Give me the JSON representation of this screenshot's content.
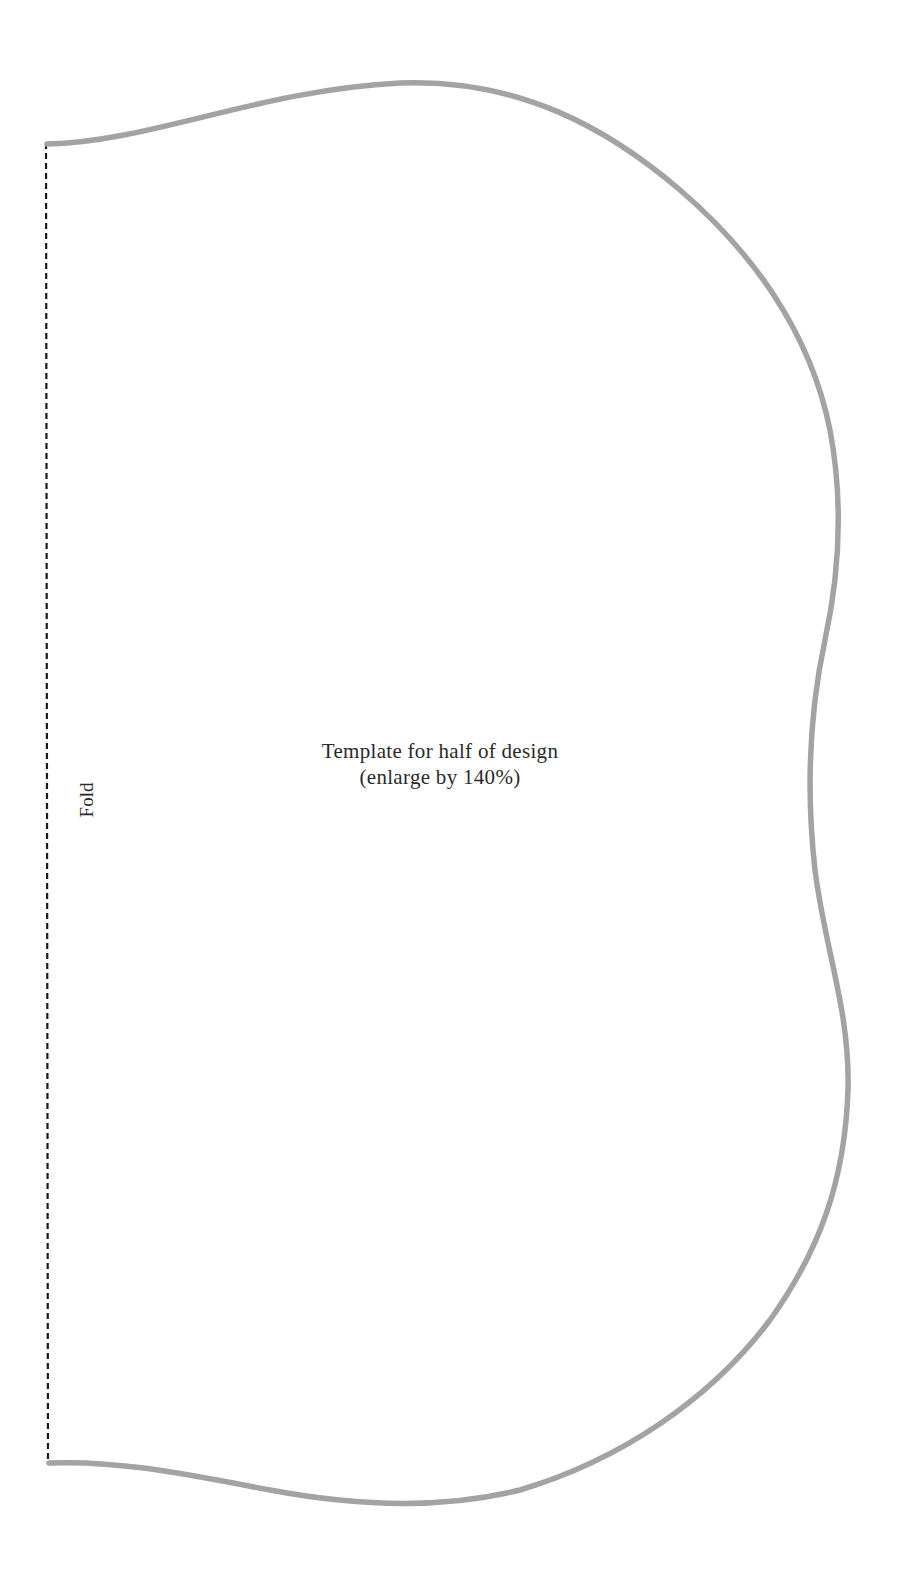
{
  "template": {
    "caption_line1": "Template for half of design",
    "caption_line2": "(enlarge by 140%)",
    "fold_label": "Fold"
  },
  "colors": {
    "outline": "#a3a3a3",
    "fold_line": "#1a1a1a",
    "text": "#2a2a2a",
    "background": "#ffffff"
  }
}
